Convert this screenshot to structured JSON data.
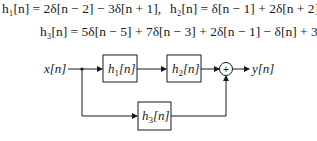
{
  "equations": {
    "h1": "h₁[n] = 2δ[n − 2] − 3δ[n + 1],",
    "h2": "h₂[n] = δ[n − 1] + 2δ[n + 2],",
    "h3": "h₃[n] = 5δ[n − 5] + 7δ[n − 3] + 2δ[n − 1] − δ[n] + 3δ[n + 1]."
  },
  "diagram": {
    "input_label": "x[n]",
    "output_label": "y[n]",
    "blocks": [
      {
        "id": "h1",
        "name": "h",
        "subscript": "1",
        "arg": "[n]"
      },
      {
        "id": "h2",
        "name": "h",
        "subscript": "2",
        "arg": "[n]"
      },
      {
        "id": "h3",
        "name": "h",
        "subscript": "3",
        "arg": "[n]"
      }
    ],
    "summer_symbol": "+"
  }
}
